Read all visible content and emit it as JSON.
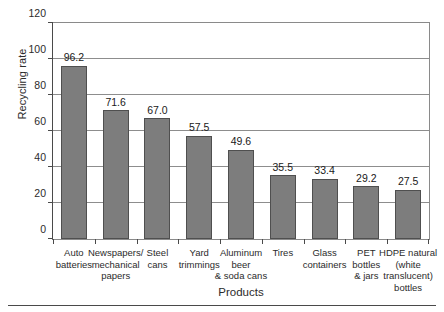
{
  "chart_data": {
    "type": "bar",
    "title": "",
    "xlabel": "Products",
    "ylabel": "Recycling rate",
    "ylim": [
      0,
      120
    ],
    "yticks": [
      0,
      20,
      40,
      60,
      80,
      100,
      120
    ],
    "grid": true,
    "legend": false,
    "categories": [
      "Auto\nbatteries",
      "Newspapers/\nmechanical\npapers",
      "Steel\ncans",
      "Yard\ntrimmings",
      "Aluminum\nbeer\n& soda cans",
      "Tires",
      "Glass\ncontainers",
      "PET\nbottles\n& jars",
      "HDPE natural\n(white\ntranslucent)\nbottles"
    ],
    "values": [
      96.2,
      71.6,
      67.0,
      57.5,
      49.6,
      35.5,
      33.4,
      29.2,
      27.5
    ],
    "value_labels": [
      "96.2",
      "71.6",
      "67.0",
      "57.5",
      "49.6",
      "35.5",
      "33.4",
      "29.2",
      "27.5"
    ],
    "ytick_labels": [
      "0",
      "20",
      "40",
      "60",
      "80",
      "100",
      "120"
    ],
    "colors": {
      "bar_fill": "#7d7d7d",
      "bar_edge": "#4f4f4f",
      "grid": "#8d8d8d",
      "axis": "#4a4a4a",
      "text": "#2b2b2b",
      "background": "#ffffff"
    }
  }
}
